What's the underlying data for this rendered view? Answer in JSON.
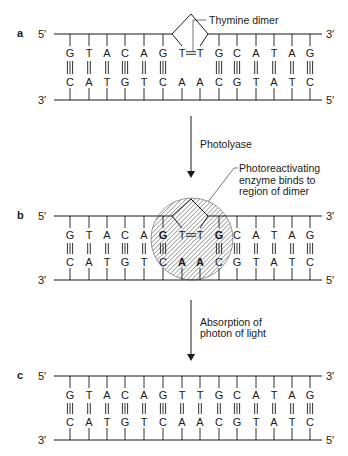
{
  "colors": {
    "ink": "#1a1a1a",
    "background": "#ffffff",
    "hatch": "#333333"
  },
  "base_x": [
    70,
    89,
    107,
    125,
    144,
    163,
    182,
    200,
    219,
    237,
    256,
    274,
    292,
    310
  ],
  "strand_x": [
    54,
    322
  ],
  "panels": [
    {
      "id": "a",
      "label": "a",
      "top_y": 34,
      "bottom_y": 100,
      "top_left_end": "5′",
      "top_right_end": "3′",
      "bottom_left_end": "3′",
      "bottom_right_end": "5′",
      "top_strand": [
        "G",
        "T",
        "A",
        "C",
        "A",
        "G",
        "T",
        "T",
        "G",
        "C",
        "A",
        "T",
        "A",
        "G"
      ],
      "bottom_strand": [
        "C",
        "A",
        "T",
        "G",
        "T",
        "C",
        "A",
        "A",
        "C",
        "G",
        "T",
        "A",
        "T",
        "C"
      ],
      "bonds": [
        3,
        2,
        2,
        3,
        2,
        3,
        0,
        0,
        3,
        3,
        2,
        2,
        2,
        3
      ],
      "dimer": {
        "label": "Thymine dimer",
        "link_symbol": "="
      }
    },
    {
      "id": "b",
      "label": "b",
      "top_y": 216,
      "bottom_y": 280,
      "top_left_end": "5′",
      "top_right_end": "3′",
      "bottom_left_end": "3′",
      "bottom_right_end": "5′",
      "top_strand": [
        "G",
        "T",
        "A",
        "C",
        "A",
        "G",
        "T",
        "T",
        "G",
        "C",
        "A",
        "T",
        "A",
        "G"
      ],
      "bottom_strand": [
        "C",
        "A",
        "T",
        "G",
        "T",
        "C",
        "A",
        "A",
        "C",
        "G",
        "T",
        "A",
        "T",
        "C"
      ],
      "bonds": [
        3,
        2,
        2,
        3,
        2,
        3,
        0,
        0,
        3,
        3,
        2,
        2,
        2,
        3
      ],
      "dimer": {
        "label": "",
        "link_symbol": "="
      },
      "enzyme": {
        "label_lines": [
          "Photoreactivating",
          "enzyme binds to",
          "region of dimer"
        ],
        "cx": 192,
        "cy": 239,
        "r": 41
      }
    },
    {
      "id": "c",
      "label": "c",
      "top_y": 376,
      "bottom_y": 440,
      "top_left_end": "5′",
      "top_right_end": "3′",
      "bottom_left_end": "3′",
      "bottom_right_end": "5′",
      "top_strand": [
        "G",
        "T",
        "A",
        "C",
        "A",
        "G",
        "T",
        "T",
        "G",
        "C",
        "A",
        "T",
        "A",
        "G"
      ],
      "bottom_strand": [
        "C",
        "A",
        "T",
        "G",
        "T",
        "C",
        "A",
        "A",
        "C",
        "G",
        "T",
        "A",
        "T",
        "C"
      ],
      "bonds": [
        3,
        2,
        2,
        3,
        2,
        3,
        2,
        2,
        2,
        3,
        2,
        2,
        2,
        3
      ]
    }
  ],
  "steps": [
    {
      "label_lines": [
        "Photolyase"
      ],
      "x": 191,
      "y_start": 116,
      "y_end": 178,
      "text_x": 200,
      "text_y": 148
    },
    {
      "label_lines": [
        "Absorption of",
        "photon of light"
      ],
      "x": 191,
      "y_start": 300,
      "y_end": 361,
      "text_x": 200,
      "text_y": 326
    }
  ]
}
